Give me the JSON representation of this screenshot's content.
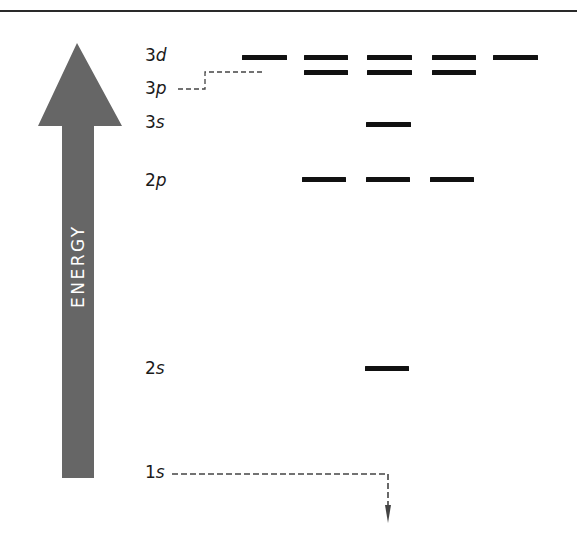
{
  "diagram": {
    "title": "",
    "axis_label": "ENERGY",
    "colors": {
      "arrow": "#666666",
      "arrow_text": "#ffffff",
      "bars": "#111111",
      "dashed_lines": "#444444",
      "rule": "#2a2a2a"
    },
    "levels": [
      {
        "n": "3",
        "l": "d",
        "orbitals": 5
      },
      {
        "n": "3",
        "l": "p",
        "orbitals": 3
      },
      {
        "n": "3",
        "l": "s",
        "orbitals": 1
      },
      {
        "n": "2",
        "l": "p",
        "orbitals": 3
      },
      {
        "n": "2",
        "l": "s",
        "orbitals": 1
      },
      {
        "n": "1",
        "l": "s",
        "orbitals": 1
      }
    ],
    "notes": {
      "p3_leader": "dashed leader from 3p label to 3p orbital row",
      "s1_leader": "dashed leader from 1s label down and off-diagram"
    }
  }
}
